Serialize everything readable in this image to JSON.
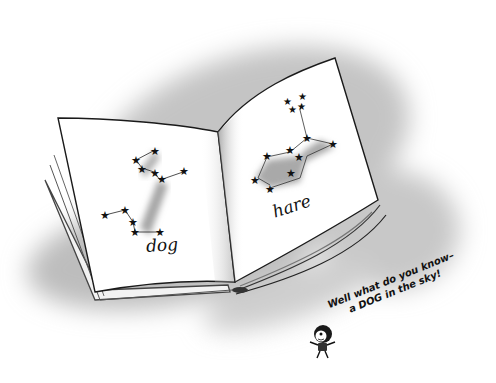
{
  "illustration": {
    "subject": "open book showing star constellations",
    "left_page": {
      "label": "dog",
      "constellation": "dog"
    },
    "right_page": {
      "label": "hare",
      "constellation": "hare"
    },
    "caption": {
      "line1": "Well what do you know–",
      "line2": "a DOG in the sky!"
    },
    "character": "small cartoon child with dark hair, arms out"
  },
  "colors": {
    "background": "#ffffff",
    "shadow": "#b8b8b8",
    "page": "#ffffff",
    "ink": "#111111",
    "constellation_fill": "#a9a9a9"
  }
}
